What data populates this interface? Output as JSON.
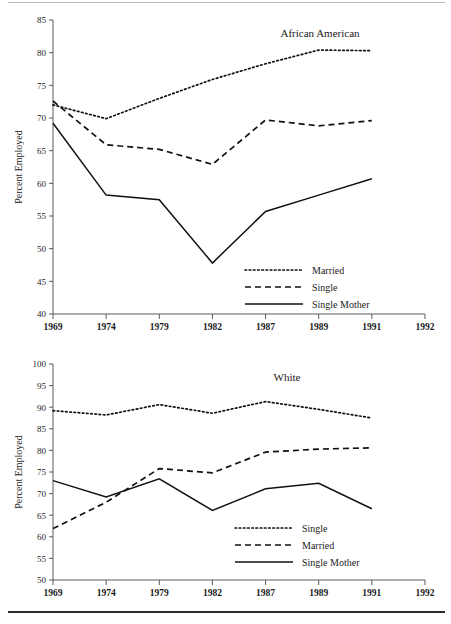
{
  "figure": {
    "rule_top": "horizontal-rule",
    "rule_bottom": "horizontal-rule",
    "line_color": "#111111",
    "axis_color": "#5a5a5a"
  },
  "chart_data": [
    {
      "id": "african-american",
      "type": "line",
      "title": "African American",
      "xlabel": "",
      "ylabel": "Percent Employed",
      "x": [
        "1969",
        "1974",
        "1979",
        "1982",
        "1987",
        "1989",
        "1991",
        "1992"
      ],
      "xtick_labels": [
        "1969",
        "1974",
        "1979",
        "1982",
        "1987",
        "1989",
        "1991",
        "1992"
      ],
      "ytick_labels": [
        "40",
        "45",
        "50",
        "55",
        "60",
        "65",
        "70",
        "75",
        "80",
        "85"
      ],
      "yticks": [
        40,
        45,
        50,
        55,
        60,
        65,
        70,
        75,
        80,
        85
      ],
      "ylim": [
        40,
        85
      ],
      "grid": false,
      "legend_position": "lower-right",
      "series": [
        {
          "name": "Married",
          "style": "dotted",
          "categories": [
            "1969",
            "1974",
            "1979",
            "1982",
            "1987",
            "1989",
            "1991"
          ],
          "values": [
            72.0,
            69.9,
            73.0,
            75.9,
            78.3,
            80.4,
            80.3
          ]
        },
        {
          "name": "Single",
          "style": "dashed",
          "categories": [
            "1969",
            "1974",
            "1979",
            "1982",
            "1987",
            "1989",
            "1991"
          ],
          "values": [
            72.6,
            65.9,
            65.2,
            62.9,
            69.7,
            68.8,
            69.6
          ]
        },
        {
          "name": "Single Mother",
          "style": "solid",
          "categories": [
            "1969",
            "1974",
            "1979",
            "1982",
            "1987",
            "1989",
            "1991"
          ],
          "values": [
            69.2,
            58.2,
            57.5,
            47.8,
            55.7,
            58.2,
            60.7
          ]
        }
      ],
      "legend": [
        {
          "label": "Married",
          "style": "dotted"
        },
        {
          "label": "Single",
          "style": "dashed"
        },
        {
          "label": "Single Mother",
          "style": "solid"
        }
      ]
    },
    {
      "id": "white",
      "type": "line",
      "title": "White",
      "xlabel": "",
      "ylabel": "Percent Employed",
      "x": [
        "1969",
        "1974",
        "1979",
        "1982",
        "1987",
        "1989",
        "1991",
        "1992"
      ],
      "xtick_labels": [
        "1969",
        "1974",
        "1979",
        "1982",
        "1987",
        "1989",
        "1991",
        "1992"
      ],
      "ytick_labels": [
        "50",
        "55",
        "60",
        "65",
        "70",
        "75",
        "80",
        "85",
        "90",
        "95",
        "100"
      ],
      "yticks": [
        50,
        55,
        60,
        65,
        70,
        75,
        80,
        85,
        90,
        95,
        100
      ],
      "ylim": [
        50,
        100
      ],
      "grid": false,
      "legend_position": "lower-right",
      "series": [
        {
          "name": "Single",
          "style": "dotted",
          "categories": [
            "1969",
            "1974",
            "1979",
            "1982",
            "1987",
            "1989",
            "1991"
          ],
          "values": [
            89.2,
            88.2,
            90.6,
            88.6,
            91.3,
            89.5,
            87.5
          ]
        },
        {
          "name": "Married",
          "style": "dashed",
          "categories": [
            "1969",
            "1974",
            "1979",
            "1982",
            "1987",
            "1989",
            "1991"
          ],
          "values": [
            61.9,
            68.0,
            75.8,
            74.8,
            79.6,
            80.3,
            80.6
          ]
        },
        {
          "name": "Single Mother",
          "style": "solid",
          "categories": [
            "1969",
            "1974",
            "1979",
            "1982",
            "1987",
            "1989",
            "1991"
          ],
          "values": [
            73.0,
            69.2,
            73.4,
            66.1,
            71.1,
            72.4,
            66.5
          ]
        }
      ],
      "legend": [
        {
          "label": "Single",
          "style": "dotted"
        },
        {
          "label": "Married",
          "style": "dashed"
        },
        {
          "label": "Single Mother",
          "style": "solid"
        }
      ]
    }
  ]
}
